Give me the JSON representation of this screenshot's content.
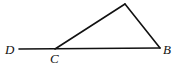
{
  "diagram": {
    "type": "geometry-triangle-with-extended-side",
    "points": {
      "D": {
        "label": "D",
        "x": 19,
        "y": 49
      },
      "C": {
        "label": "C",
        "x": 55,
        "y": 49
      },
      "B": {
        "label": "B",
        "x": 160,
        "y": 48
      },
      "A": {
        "label": "",
        "x": 125,
        "y": 4
      }
    },
    "segments": [
      {
        "from": "D",
        "to": "B",
        "name": "line-DB"
      },
      {
        "from": "C",
        "to": "A",
        "name": "side-CA"
      },
      {
        "from": "A",
        "to": "B",
        "name": "side-AB"
      }
    ],
    "labels": {
      "D": "D",
      "C": "C",
      "B": "B"
    },
    "colors": {
      "stroke": "#111111",
      "background": "#ffffff"
    }
  }
}
